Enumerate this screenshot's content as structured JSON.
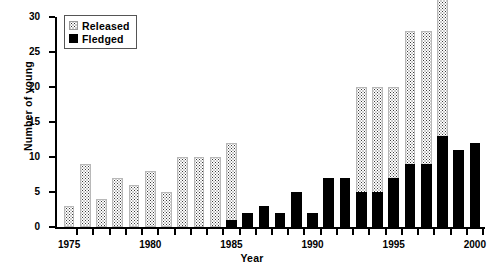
{
  "chart_data": {
    "type": "bar",
    "subtype": "stacked",
    "title": "",
    "xlabel": "Year",
    "ylabel": "Number of young",
    "ylim": [
      0,
      30
    ],
    "yticks": [
      0,
      5,
      10,
      15,
      20,
      25,
      30
    ],
    "xlim": [
      1974.5,
      2000.5
    ],
    "xticks": [
      1975,
      1980,
      1985,
      1990,
      1995,
      2000
    ],
    "xtick_labels": [
      "1975",
      "1980",
      "1985",
      "1990",
      "1995",
      "2000"
    ],
    "grid": false,
    "legend_position": "upper left",
    "categories": [
      "1975",
      "1976",
      "1977",
      "1978",
      "1979",
      "1980",
      "1981",
      "1982",
      "1983",
      "1984",
      "1985",
      "1986",
      "1987",
      "1988",
      "1989",
      "1990",
      "1991",
      "1992",
      "1993",
      "1994",
      "1995",
      "1996",
      "1997",
      "1998",
      "1999",
      "2000"
    ],
    "series": [
      {
        "name": "Released",
        "fill": "stipple",
        "values": [
          3,
          9,
          4,
          7,
          6,
          8,
          5,
          10,
          10,
          10,
          11,
          0,
          0,
          0,
          0,
          0,
          0,
          0,
          15,
          15,
          13,
          19,
          19,
          25,
          0,
          0
        ]
      },
      {
        "name": "Fledged",
        "fill": "solid-black",
        "values": [
          0,
          0,
          0,
          0,
          0,
          0,
          0,
          0,
          0,
          0,
          1,
          2,
          3,
          2,
          5,
          2,
          7,
          7,
          5,
          5,
          7,
          9,
          9,
          13,
          11,
          12
        ]
      }
    ],
    "totals": [
      3,
      9,
      4,
      7,
      6,
      8,
      5,
      10,
      10,
      10,
      11,
      2,
      3,
      2,
      5,
      2,
      7,
      7,
      15,
      15,
      13,
      19,
      19,
      25,
      11,
      12
    ]
  },
  "legend": {
    "items": [
      {
        "label": "Released",
        "swatch": "stipple-swatch"
      },
      {
        "label": "Fledged",
        "swatch": "black-swatch"
      }
    ]
  }
}
